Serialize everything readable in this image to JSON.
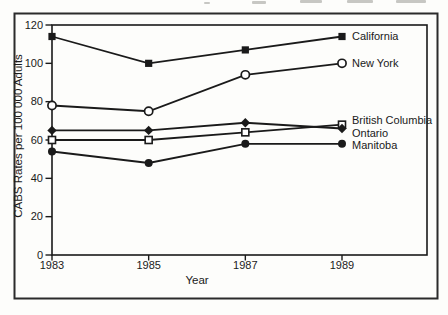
{
  "figure": {
    "xlabel": "Year",
    "ylabel": "CABS Rates per 100 000 Adults"
  },
  "colors": {
    "ink": "#1a1a1a",
    "frame": "#2b2b2b",
    "paper": "#fdfdfb"
  },
  "chart_data": {
    "type": "line",
    "title": "",
    "xlabel": "Year",
    "ylabel": "CABS Rates per 100 000 Adults",
    "x": [
      1983,
      1985,
      1987,
      1989
    ],
    "xticklabels": [
      "1983",
      "1985",
      "1987",
      "1989"
    ],
    "ylim": [
      0,
      120
    ],
    "yticks": [
      0,
      20,
      40,
      60,
      80,
      100,
      120
    ],
    "grid": false,
    "legend_position": "labels-right-of-last-point",
    "series": [
      {
        "name": "California",
        "marker": "filled-square",
        "values": [
          114,
          100,
          107,
          114
        ],
        "label_dy": 0
      },
      {
        "name": "New York",
        "marker": "open-circle",
        "values": [
          78,
          75,
          94,
          100
        ],
        "label_dy": 0
      },
      {
        "name": "British Columbia",
        "marker": "open-square",
        "values": [
          60,
          60,
          64,
          68
        ],
        "label_dy": -4
      },
      {
        "name": "Ontario",
        "marker": "filled-diamond",
        "values": [
          65,
          65,
          69,
          66
        ],
        "label_dy": 5
      },
      {
        "name": "Manitoba",
        "marker": "filled-circle",
        "values": [
          54,
          48,
          58,
          58
        ],
        "label_dy": 1
      }
    ]
  }
}
